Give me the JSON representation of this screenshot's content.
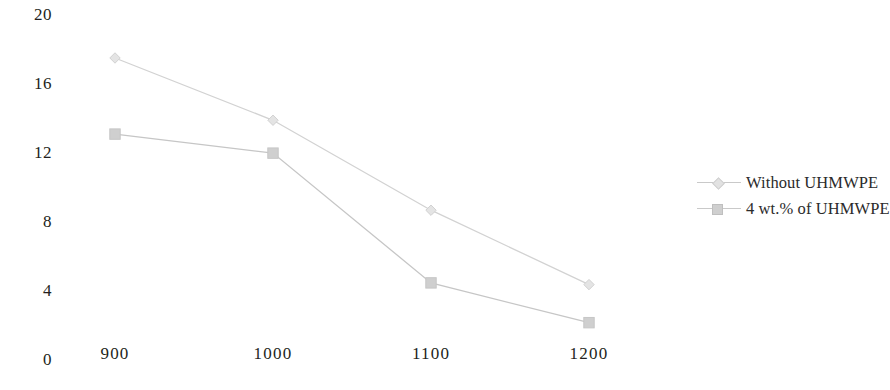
{
  "chart_data": {
    "type": "line",
    "title": "",
    "subtitle": "",
    "xlabel": "",
    "ylabel": "",
    "x": [
      900,
      1000,
      1100,
      1200
    ],
    "categories": [
      "900",
      "1000",
      "1100",
      "1200"
    ],
    "xlim": [
      850,
      1250
    ],
    "ylim": [
      0,
      20
    ],
    "grid": false,
    "legend_position": "right",
    "y_ticks": [
      {
        "label": "20",
        "value": 20
      },
      {
        "label": "16",
        "value": 16
      },
      {
        "label": "12",
        "value": 12
      },
      {
        "label": "8",
        "value": 8
      },
      {
        "label": "4",
        "value": 4
      },
      {
        "label": "0",
        "value": 0
      }
    ],
    "x_ticks": [
      {
        "label": "900",
        "value": 900
      },
      {
        "label": "1000",
        "value": 1000
      },
      {
        "label": "1100",
        "value": 1100
      },
      {
        "label": "1200",
        "value": 1200
      }
    ],
    "series": [
      {
        "name": "Without UHMWPE",
        "marker": "diamond",
        "color": "#d2d2d2",
        "marker_fill": "#e4e4e4",
        "values": [
          17.4,
          13.8,
          8.6,
          4.3
        ]
      },
      {
        "name": "4 wt.% of UHMWPE",
        "marker": "square",
        "color": "#c6c6c6",
        "marker_fill": "#cfcfcf",
        "values": [
          13.0,
          11.9,
          4.4,
          2.1
        ]
      }
    ]
  },
  "legend": {
    "items": [
      {
        "label": "Without UHMWPE",
        "marker": "diamond-marker-icon"
      },
      {
        "label": "4 wt.% of UHMWPE",
        "marker": "square-marker-icon"
      }
    ]
  },
  "colors": {
    "series_1_line": "#d2d2d2",
    "series_2_line": "#c6c6c6",
    "tick_text": "#231f20",
    "legend_text": "#2b2b2b",
    "background": "#ffffff"
  }
}
